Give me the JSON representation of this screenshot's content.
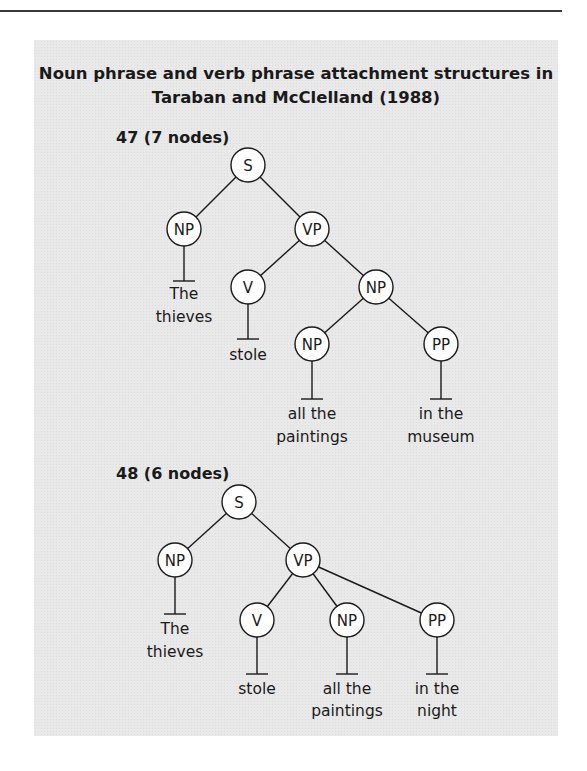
{
  "figure": {
    "title_line1": "Noun phrase and verb phrase attachment structures in",
    "title_line2": "Taraban and McClelland (1988)",
    "colors": {
      "panel_background": "#e9e9e9",
      "node_fill": "#ffffff",
      "stroke": "#1a1a1a",
      "top_rule": "#3a3a3a"
    }
  },
  "trees": [
    {
      "label": "47 (7 nodes)",
      "nodes": [
        {
          "id": "S",
          "label": "S"
        },
        {
          "id": "NP1",
          "label": "NP"
        },
        {
          "id": "VP",
          "label": "VP"
        },
        {
          "id": "V",
          "label": "V"
        },
        {
          "id": "NP2",
          "label": "NP"
        },
        {
          "id": "NP3",
          "label": "NP"
        },
        {
          "id": "PP",
          "label": "PP"
        }
      ],
      "edges": [
        [
          "S",
          "NP1"
        ],
        [
          "S",
          "VP"
        ],
        [
          "VP",
          "V"
        ],
        [
          "VP",
          "NP2"
        ],
        [
          "NP2",
          "NP3"
        ],
        [
          "NP2",
          "PP"
        ]
      ],
      "leaves": [
        {
          "parent": "NP1",
          "line1": "The",
          "line2": "thieves"
        },
        {
          "parent": "V",
          "line1": "stole",
          "line2": ""
        },
        {
          "parent": "NP3",
          "line1": "all the",
          "line2": "paintings"
        },
        {
          "parent": "PP",
          "line1": "in the",
          "line2": "museum"
        }
      ]
    },
    {
      "label": "48 (6 nodes)",
      "nodes": [
        {
          "id": "S",
          "label": "S"
        },
        {
          "id": "NP1",
          "label": "NP"
        },
        {
          "id": "VP",
          "label": "VP"
        },
        {
          "id": "V",
          "label": "V"
        },
        {
          "id": "NP2",
          "label": "NP"
        },
        {
          "id": "PP",
          "label": "PP"
        }
      ],
      "edges": [
        [
          "S",
          "NP1"
        ],
        [
          "S",
          "VP"
        ],
        [
          "VP",
          "V"
        ],
        [
          "VP",
          "NP2"
        ],
        [
          "VP",
          "PP"
        ]
      ],
      "leaves": [
        {
          "parent": "NP1",
          "line1": "The",
          "line2": "thieves"
        },
        {
          "parent": "V",
          "line1": "stole",
          "line2": ""
        },
        {
          "parent": "NP2",
          "line1": "all the",
          "line2": "paintings"
        },
        {
          "parent": "PP",
          "line1": "in the",
          "line2": "night"
        }
      ]
    }
  ]
}
